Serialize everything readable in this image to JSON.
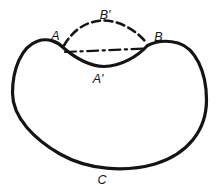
{
  "figure": {
    "colors": {
      "background": "#ffffff",
      "line": "#141414"
    },
    "labels": {
      "point_a": "A",
      "point_b": "B",
      "outer_dashed_arc": "B'",
      "inner_solid_arc": "A'",
      "main_curve": "C"
    }
  }
}
